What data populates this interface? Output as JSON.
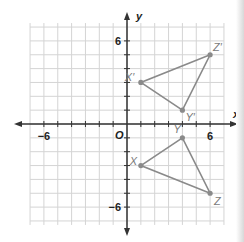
{
  "figure": {
    "axes": {
      "x_label": "x",
      "y_label": "y",
      "origin_label": "O",
      "x_ticks_labeled": [
        {
          "value": -6,
          "label": "−6"
        },
        {
          "value": 6,
          "label": "6"
        }
      ],
      "y_ticks_labeled": [
        {
          "value": 6,
          "label": "6"
        },
        {
          "value": -6,
          "label": "−6"
        }
      ],
      "range": {
        "xmin": -7,
        "xmax": 7,
        "ymin": -7,
        "ymax": 7
      }
    },
    "triangles": [
      {
        "name": "XYZ",
        "points": [
          {
            "label": "X",
            "x": 1,
            "y": -3
          },
          {
            "label": "Y",
            "x": 4,
            "y": -1
          },
          {
            "label": "Z",
            "x": 6,
            "y": -5
          }
        ]
      },
      {
        "name": "X'Y'Z'",
        "points": [
          {
            "label": "X′",
            "x": 1,
            "y": 3
          },
          {
            "label": "Y′",
            "x": 4,
            "y": 1
          },
          {
            "label": "Z′",
            "x": 6,
            "y": 5
          }
        ]
      }
    ],
    "colors": {
      "grid": "#d4d4d4",
      "axis": "#333333",
      "shape": "#8a8a8a",
      "label": "#7a7a7a"
    }
  }
}
